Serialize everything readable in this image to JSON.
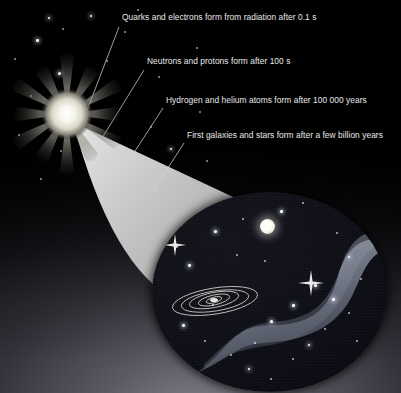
{
  "figure": {
    "background_top_color": "#000000",
    "background_bottom_color": "#8e8e96",
    "label_text_color": "#e9e9ea",
    "cone_color": "#c9c9c9",
    "leader_line_color": "#d8d8d8"
  },
  "annotations": [
    {
      "id": "quarks",
      "text": "Quarks and electrons form from radiation after 0.1 s",
      "x": 122,
      "y": 12
    },
    {
      "id": "neutrons",
      "text": "Neutrons and protons form after 100 s",
      "x": 147,
      "y": 56
    },
    {
      "id": "atoms",
      "text": "Hydrogen and helium atoms form after 100 000 years",
      "x": 166,
      "y": 95
    },
    {
      "id": "galaxies",
      "text": "First galaxies and stars form after a few billion years",
      "x": 187,
      "y": 130
    }
  ],
  "elements": {
    "starburst": {
      "name": "big-bang-starburst",
      "ray_count": 12,
      "core_color": "#f2f2ee"
    },
    "cone": {
      "name": "expansion-cone",
      "apex_x": 73,
      "apex_y": 122
    },
    "universe_circle": {
      "name": "universe-view-circle",
      "center_x": 270,
      "center_y": 292,
      "radius_x": 118,
      "radius_y": 100
    },
    "galaxy": {
      "name": "spiral-galaxy",
      "ring_count": 5
    },
    "nebula": {
      "name": "nebula-band",
      "color": "#8a8f9c"
    },
    "bright_star": {
      "name": "bright-star",
      "x": 268,
      "y": 226
    }
  },
  "stars": [
    {
      "x": 36,
      "y": 39,
      "r": 1.3,
      "glow": true
    },
    {
      "x": 62,
      "y": 28,
      "r": 1.0,
      "glow": false
    },
    {
      "x": 90,
      "y": 15,
      "r": 1.2,
      "glow": true
    },
    {
      "x": 124,
      "y": 31,
      "r": 1.0,
      "glow": false
    },
    {
      "x": 137,
      "y": 9,
      "r": 1.1,
      "glow": false
    },
    {
      "x": 30,
      "y": 95,
      "r": 1.0,
      "glow": false
    },
    {
      "x": 58,
      "y": 72,
      "r": 1.5,
      "glow": true
    },
    {
      "x": 78,
      "y": 112,
      "r": 1.0,
      "glow": false
    },
    {
      "x": 18,
      "y": 134,
      "r": 1.2,
      "glow": false
    },
    {
      "x": 14,
      "y": 58,
      "r": 1.0,
      "glow": false
    },
    {
      "x": 48,
      "y": 17,
      "r": 1.1,
      "glow": true
    },
    {
      "x": 106,
      "y": 60,
      "r": 1.0,
      "glow": false
    },
    {
      "x": 196,
      "y": 47,
      "r": 1.0,
      "glow": false
    },
    {
      "x": 158,
      "y": 76,
      "r": 1.1,
      "glow": false
    },
    {
      "x": 150,
      "y": 126,
      "r": 1.0,
      "glow": false
    },
    {
      "x": 170,
      "y": 148,
      "r": 1.2,
      "glow": true
    },
    {
      "x": 199,
      "y": 111,
      "r": 1.0,
      "glow": false
    },
    {
      "x": 206,
      "y": 160,
      "r": 1.0,
      "glow": false
    },
    {
      "x": 60,
      "y": 150,
      "r": 1.0,
      "glow": false
    },
    {
      "x": 40,
      "y": 178,
      "r": 1.2,
      "glow": false
    }
  ],
  "universe_stars": [
    {
      "x": 62,
      "y": 38,
      "r": 1.5,
      "glow": true
    },
    {
      "x": 36,
      "y": 72,
      "r": 1.4,
      "glow": true
    },
    {
      "x": 90,
      "y": 26,
      "r": 1.1,
      "glow": false
    },
    {
      "x": 128,
      "y": 18,
      "r": 1.3,
      "glow": true
    },
    {
      "x": 150,
      "y": 10,
      "r": 1.0,
      "glow": false
    },
    {
      "x": 60,
      "y": 112,
      "r": 1.0,
      "glow": false
    },
    {
      "x": 30,
      "y": 132,
      "r": 1.4,
      "glow": true
    },
    {
      "x": 52,
      "y": 148,
      "r": 1.1,
      "glow": false
    },
    {
      "x": 102,
      "y": 150,
      "r": 1.2,
      "glow": false
    },
    {
      "x": 118,
      "y": 128,
      "r": 1.5,
      "glow": true
    },
    {
      "x": 140,
      "y": 112,
      "r": 1.3,
      "glow": true
    },
    {
      "x": 162,
      "y": 92,
      "r": 1.6,
      "glow": true
    },
    {
      "x": 180,
      "y": 106,
      "r": 1.3,
      "glow": true
    },
    {
      "x": 196,
      "y": 120,
      "r": 1.2,
      "glow": false
    },
    {
      "x": 172,
      "y": 136,
      "r": 1.1,
      "glow": false
    },
    {
      "x": 196,
      "y": 64,
      "r": 1.2,
      "glow": true
    },
    {
      "x": 208,
      "y": 86,
      "r": 1.0,
      "glow": false
    },
    {
      "x": 184,
      "y": 40,
      "r": 1.0,
      "glow": false
    },
    {
      "x": 96,
      "y": 176,
      "r": 1.2,
      "glow": true
    },
    {
      "x": 118,
      "y": 186,
      "r": 1.1,
      "glow": false
    },
    {
      "x": 78,
      "y": 162,
      "r": 1.0,
      "glow": false
    },
    {
      "x": 140,
      "y": 166,
      "r": 1.0,
      "glow": false
    },
    {
      "x": 156,
      "y": 152,
      "r": 1.2,
      "glow": true
    },
    {
      "x": 24,
      "y": 54,
      "r": 1.0,
      "glow": false
    },
    {
      "x": 204,
      "y": 148,
      "r": 1.0,
      "glow": false
    },
    {
      "x": 84,
      "y": 62,
      "r": 1.0,
      "glow": false
    },
    {
      "x": 112,
      "y": 68,
      "r": 1.0,
      "glow": false
    }
  ]
}
